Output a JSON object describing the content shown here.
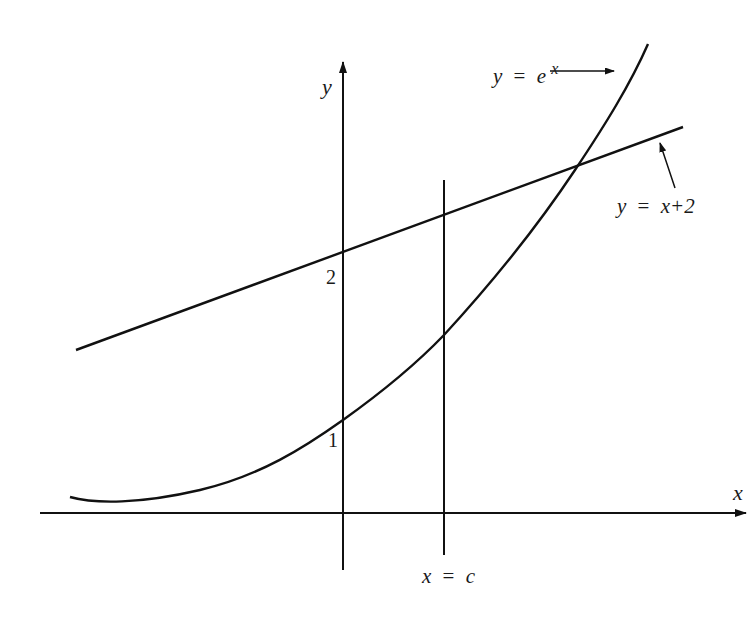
{
  "diagram": {
    "type": "function-graph",
    "axes": {
      "x_label": "x",
      "y_label": "y"
    },
    "tick_labels": {
      "y_two": "2",
      "y_one": "1"
    },
    "curves": [
      {
        "name": "exponential",
        "label_lhs": "y",
        "label_eq": "=",
        "label_base": "e",
        "label_exp": "x"
      },
      {
        "name": "line",
        "label_lhs": "y",
        "label_eq": "=",
        "label_rhs": "x+2"
      }
    ],
    "vertical_line": {
      "label_lhs": "x",
      "label_eq": "=",
      "label_rhs": "c"
    },
    "colors": {
      "stroke": "#111111",
      "background": "#ffffff"
    }
  }
}
